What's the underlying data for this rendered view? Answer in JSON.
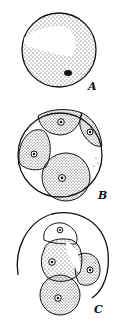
{
  "figure": {
    "panels": [
      {
        "id": "A",
        "label": "A",
        "description": "Single undivided cell with clear vacuole region and dark nucleus"
      },
      {
        "id": "B",
        "label": "B",
        "description": "Cell divided into four dotted daughter cells each with a nucleus"
      },
      {
        "id": "C",
        "label": "C",
        "description": "Four daughter cells emerging from open parent wall"
      }
    ],
    "colors": {
      "ink": "#111111",
      "background": "#ffffff"
    }
  }
}
